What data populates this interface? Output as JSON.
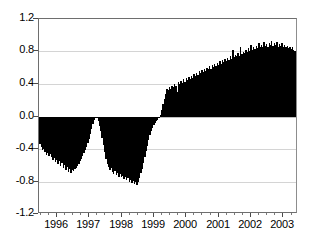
{
  "chart_data": {
    "type": "bar",
    "title": "",
    "subtitle": "",
    "xlabel": "",
    "ylabel": "",
    "ylim": [
      -1.2,
      1.2
    ],
    "xlim": [
      1995.45,
      2003.45
    ],
    "grid": true,
    "legend": null,
    "annotations": [],
    "yticks": [
      "1.2",
      "0.8",
      "0.4",
      "0.0",
      "-0.4",
      "-0.8",
      "-1.2"
    ],
    "ytick_values": [
      1.2,
      0.8,
      0.4,
      0.0,
      -0.4,
      -0.8,
      -1.2
    ],
    "xticks": [
      "1996",
      "1997",
      "1998",
      "1999",
      "2000",
      "2001",
      "2002",
      "2003"
    ],
    "xtick_values": [
      1996,
      1997,
      1998,
      1999,
      2000,
      2001,
      2002,
      2003
    ],
    "x_minor_per_major": 4,
    "bar_color": "#000000",
    "grid_color": "#cccccc",
    "axis_color": "#6e6e6e",
    "series_name": "value",
    "x": [
      1995.48,
      1995.52,
      1995.56,
      1995.6,
      1995.64,
      1995.68,
      1995.72,
      1995.76,
      1995.8,
      1995.84,
      1995.88,
      1995.92,
      1995.96,
      1996.0,
      1996.04,
      1996.08,
      1996.12,
      1996.16,
      1996.2,
      1996.24,
      1996.28,
      1996.32,
      1996.36,
      1996.4,
      1996.44,
      1996.48,
      1996.52,
      1996.56,
      1996.6,
      1996.64,
      1996.68,
      1996.72,
      1996.76,
      1996.8,
      1996.84,
      1996.88,
      1996.92,
      1996.96,
      1997.0,
      1997.04,
      1997.08,
      1997.12,
      1997.16,
      1997.2,
      1997.24,
      1997.28,
      1997.32,
      1997.36,
      1997.4,
      1997.44,
      1997.48,
      1997.52,
      1997.56,
      1997.6,
      1997.64,
      1997.68,
      1997.72,
      1997.76,
      1997.8,
      1997.84,
      1997.88,
      1997.92,
      1997.96,
      1998.0,
      1998.04,
      1998.08,
      1998.12,
      1998.16,
      1998.2,
      1998.24,
      1998.28,
      1998.32,
      1998.36,
      1998.4,
      1998.44,
      1998.48,
      1998.52,
      1998.56,
      1998.6,
      1998.64,
      1998.68,
      1998.72,
      1998.76,
      1998.8,
      1998.84,
      1998.88,
      1998.92,
      1998.96,
      1999.0,
      1999.04,
      1999.08,
      1999.12,
      1999.16,
      1999.2,
      1999.24,
      1999.28,
      1999.32,
      1999.36,
      1999.4,
      1999.44,
      1999.48,
      1999.52,
      1999.56,
      1999.6,
      1999.64,
      1999.68,
      1999.72,
      1999.76,
      1999.8,
      1999.84,
      1999.88,
      1999.92,
      1999.96,
      2000.0,
      2000.04,
      2000.08,
      2000.12,
      2000.16,
      2000.2,
      2000.24,
      2000.28,
      2000.32,
      2000.36,
      2000.4,
      2000.44,
      2000.48,
      2000.52,
      2000.56,
      2000.6,
      2000.64,
      2000.68,
      2000.72,
      2000.76,
      2000.8,
      2000.84,
      2000.88,
      2000.92,
      2000.96,
      2001.0,
      2001.04,
      2001.08,
      2001.12,
      2001.16,
      2001.2,
      2001.24,
      2001.28,
      2001.32,
      2001.36,
      2001.4,
      2001.44,
      2001.48,
      2001.52,
      2001.56,
      2001.6,
      2001.64,
      2001.68,
      2001.72,
      2001.76,
      2001.8,
      2001.84,
      2001.88,
      2001.92,
      2001.96,
      2002.0,
      2002.04,
      2002.08,
      2002.12,
      2002.16,
      2002.2,
      2002.24,
      2002.28,
      2002.32,
      2002.36,
      2002.4,
      2002.44,
      2002.48,
      2002.52,
      2002.56,
      2002.6,
      2002.64,
      2002.68,
      2002.72,
      2002.76,
      2002.8,
      2002.84,
      2002.88,
      2002.92,
      2002.96,
      2003.0,
      2003.04,
      2003.08,
      2003.12,
      2003.16,
      2003.2,
      2003.24,
      2003.28,
      2003.32,
      2003.36,
      2003.4
    ],
    "values": [
      -0.34,
      -0.38,
      -0.41,
      -0.4,
      -0.44,
      -0.47,
      -0.45,
      -0.49,
      -0.46,
      -0.5,
      -0.53,
      -0.51,
      -0.56,
      -0.54,
      -0.58,
      -0.55,
      -0.61,
      -0.57,
      -0.63,
      -0.6,
      -0.66,
      -0.62,
      -0.68,
      -0.64,
      -0.69,
      -0.66,
      -0.67,
      -0.65,
      -0.63,
      -0.61,
      -0.58,
      -0.55,
      -0.52,
      -0.49,
      -0.45,
      -0.41,
      -0.37,
      -0.33,
      -0.28,
      -0.22,
      -0.15,
      -0.09,
      -0.04,
      -0.01,
      -0.02,
      -0.06,
      -0.12,
      -0.18,
      -0.26,
      -0.35,
      -0.44,
      -0.52,
      -0.58,
      -0.62,
      -0.66,
      -0.63,
      -0.68,
      -0.71,
      -0.67,
      -0.72,
      -0.7,
      -0.74,
      -0.71,
      -0.75,
      -0.73,
      -0.77,
      -0.74,
      -0.78,
      -0.76,
      -0.8,
      -0.78,
      -0.82,
      -0.79,
      -0.83,
      -0.81,
      -0.84,
      -0.8,
      -0.76,
      -0.7,
      -0.64,
      -0.57,
      -0.5,
      -0.43,
      -0.36,
      -0.29,
      -0.23,
      -0.18,
      -0.14,
      -0.11,
      -0.08,
      -0.06,
      -0.04,
      -0.02,
      0.02,
      0.08,
      0.15,
      0.22,
      0.28,
      0.34,
      0.33,
      0.36,
      0.34,
      0.38,
      0.36,
      0.4,
      0.37,
      0.3,
      0.42,
      0.4,
      0.44,
      0.41,
      0.46,
      0.43,
      0.47,
      0.45,
      0.49,
      0.46,
      0.5,
      0.48,
      0.52,
      0.5,
      0.54,
      0.51,
      0.56,
      0.53,
      0.57,
      0.55,
      0.59,
      0.56,
      0.6,
      0.58,
      0.62,
      0.59,
      0.63,
      0.61,
      0.65,
      0.62,
      0.66,
      0.64,
      0.68,
      0.65,
      0.69,
      0.67,
      0.71,
      0.68,
      0.72,
      0.7,
      0.74,
      0.71,
      0.82,
      0.73,
      0.76,
      0.74,
      0.78,
      0.75,
      0.86,
      0.77,
      0.8,
      0.78,
      0.82,
      0.79,
      0.84,
      0.81,
      0.88,
      0.82,
      0.85,
      0.83,
      0.87,
      0.84,
      0.9,
      0.85,
      0.88,
      0.86,
      0.92,
      0.87,
      0.89,
      0.86,
      0.91,
      0.88,
      0.93,
      0.87,
      0.9,
      0.88,
      0.92,
      0.86,
      0.89,
      0.87,
      0.9,
      0.86,
      0.88,
      0.85,
      0.87,
      0.84,
      0.86,
      0.83,
      0.85,
      0.82,
      0.81,
      0.8
    ]
  }
}
